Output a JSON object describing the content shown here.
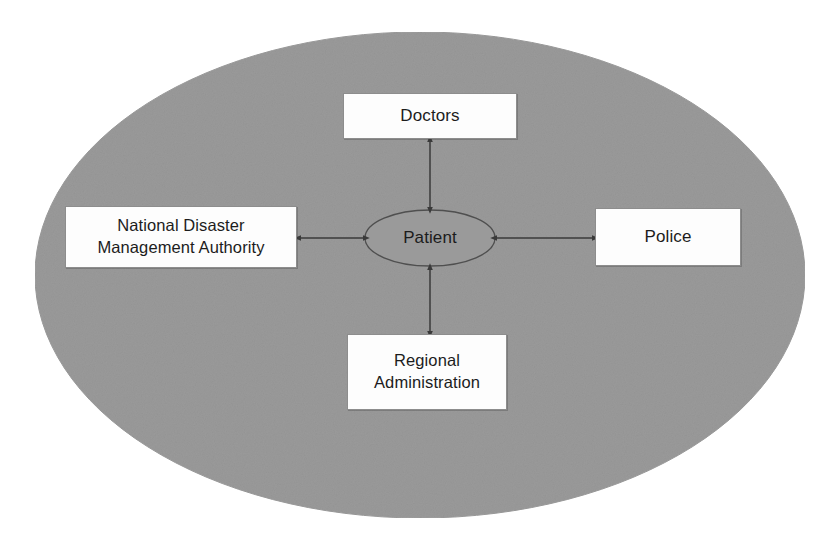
{
  "diagram": {
    "background_color": "#ffffff",
    "container": {
      "name": "grey-ellipse-container",
      "shape": "ellipse",
      "fill_color": "#9a9a9a",
      "stroke_color": "#9a9a9a"
    },
    "center_node": {
      "label": "Patient",
      "shape": "ellipse",
      "fill_color": "#9a9a9a",
      "stroke_color": "#5a5a5a",
      "text_color": "#1c1c1c"
    },
    "nodes": [
      {
        "id": "doctors",
        "label": "Doctors",
        "position": "top",
        "fill_color": "#fdfdfd",
        "stroke_color": "#8d8d8d",
        "text_color": "#1c1c1c"
      },
      {
        "id": "ndma",
        "label": "National Disaster\nManagement Authority",
        "position": "left",
        "fill_color": "#fdfdfd",
        "stroke_color": "#8d8d8d",
        "text_color": "#1c1c1c"
      },
      {
        "id": "police",
        "label": "Police",
        "position": "right",
        "fill_color": "#fdfdfd",
        "stroke_color": "#8d8d8d",
        "text_color": "#1c1c1c"
      },
      {
        "id": "regional",
        "label": "Regional\nAdministration",
        "position": "bottom",
        "fill_color": "#fdfdfd",
        "stroke_color": "#8d8d8d",
        "text_color": "#1c1c1c"
      }
    ],
    "connectors": [
      {
        "id": "doctors-patient",
        "from": "doctors",
        "to": "patient",
        "style": "double-headed-arrow",
        "color": "#3a3a3a"
      },
      {
        "id": "ndma-patient",
        "from": "ndma",
        "to": "patient",
        "style": "double-headed-arrow",
        "color": "#3a3a3a"
      },
      {
        "id": "police-patient",
        "from": "police",
        "to": "patient",
        "style": "double-headed-arrow",
        "color": "#3a3a3a"
      },
      {
        "id": "regional-patient",
        "from": "regional",
        "to": "patient",
        "style": "double-headed-arrow",
        "color": "#3a3a3a"
      }
    ]
  }
}
